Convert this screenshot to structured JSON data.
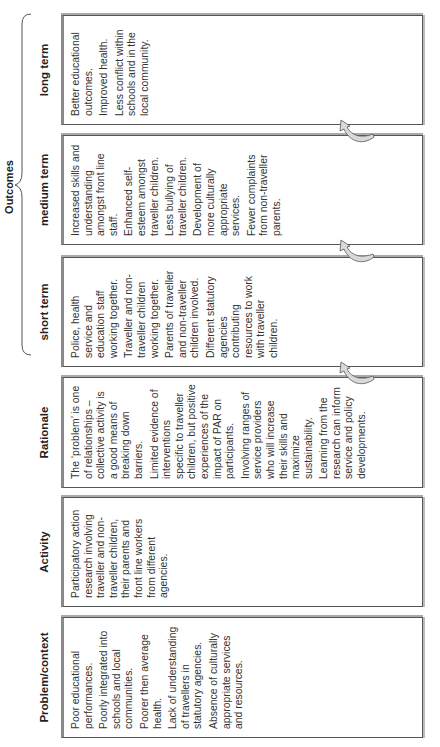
{
  "outcomes_label": "Outcomes",
  "columns": [
    {
      "id": "problem",
      "header": "Problem/context",
      "items": [
        "Poor educational performances.",
        "Poorly integrated into schools and local communities.",
        "Poorer then average health.",
        "Lack of understanding of travellers in statutory agencies.",
        "Absence of culturally appropriate services and resources."
      ]
    },
    {
      "id": "activity",
      "header": "Activity",
      "items": [
        "Participatory action research involving traveller and non-traveller children, their parents and front line workers from different agencies."
      ]
    },
    {
      "id": "rationale",
      "header": "Rationale",
      "items": [
        "The ‘problem’ is one of relationships – collective activity is a good means of breaking down barriers.",
        "Limited evidence of interventions specific to traveller children, but positive experiences of the impact of PAR on participants.",
        "Involving ranges of service providers who will increase their skills and maximize sustainability.",
        "Learning from the research can inform service and policy developments."
      ]
    },
    {
      "id": "short-term",
      "header": "short term",
      "items": [
        "Police, health service and education staff working together.",
        "Traveller and non-traveller children working together.",
        "Parents of traveller and non-traveller children involved.",
        "Different statutory agencies contributing resources to work with traveller children."
      ]
    },
    {
      "id": "medium-term",
      "header": "medium term",
      "items": [
        "Increased skills and understanding amongst front line staff.",
        "Enhanced self-esteem amongst traveller children.",
        "Less bullying of traveller children.",
        "Development of more culturally appropriate services.",
        "Fewer complaints from non-traveller parents."
      ]
    },
    {
      "id": "long-term",
      "header": "long term",
      "items": [
        "Better educational outcomes.",
        "Improved health.",
        "Less conflict within schools and in the local community."
      ]
    }
  ],
  "colors": {
    "box_border": "#555555",
    "box_top_border": "#8a8a8a",
    "arrow_fill": "#d9d9d9",
    "arrow_stroke": "#666666"
  }
}
